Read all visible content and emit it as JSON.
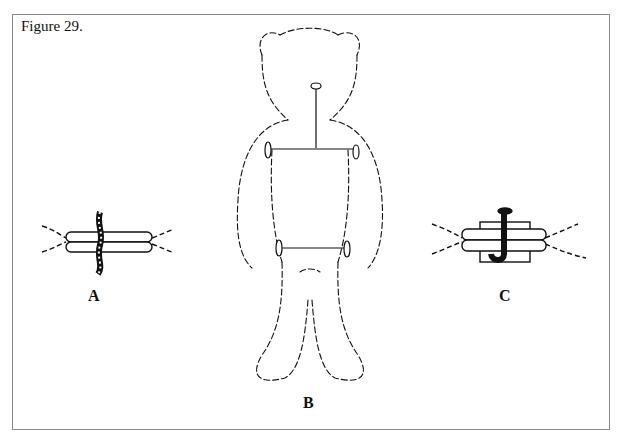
{
  "figure": {
    "title": "Figure 29.",
    "panels": [
      {
        "id": "A",
        "label": "A",
        "description": "joint disc pair secured with a twisted cotter/wire"
      },
      {
        "id": "B",
        "label": "B",
        "description": "teddy bear outline showing internal joint rods at neck, shoulders and hips"
      },
      {
        "id": "C",
        "label": "C",
        "description": "joint disc pair secured with a bent cotter pin"
      }
    ]
  },
  "colors": {
    "ink": "#111111",
    "frame": "#8a8a8a",
    "background": "#ffffff"
  }
}
